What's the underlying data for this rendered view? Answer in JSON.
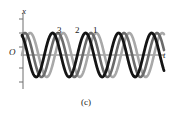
{
  "figure": {
    "caption": "(c)",
    "axes": {
      "y_label": "x",
      "x_label": "t",
      "origin_label": "O",
      "x_axis_start": 22,
      "x_axis_end": 164,
      "x_axis_y": 55,
      "y_axis_x": 23,
      "y_axis_top": 13,
      "y_axis_bottom": 89,
      "y_ticks": [
        19,
        33,
        47,
        68,
        82
      ],
      "tick_length": 4,
      "axis_color": "#6e6e6e"
    },
    "curve_labels": [
      {
        "text": "3",
        "x": 57,
        "y": 26
      },
      {
        "text": "2",
        "x": 75,
        "y": 26
      },
      {
        "text": "1",
        "x": 93,
        "y": 26
      }
    ]
  },
  "chart_data": {
    "type": "line",
    "title": "",
    "subtitle": "",
    "xlabel": "t",
    "ylabel": "x",
    "grid": false,
    "legend": "inline-labels",
    "annotations": [
      "3",
      "2",
      "1",
      "(c)"
    ],
    "xlim": [
      0,
      142
    ],
    "ylim": [
      -1.15,
      1.15
    ],
    "series": [
      {
        "name": "1",
        "label": "1",
        "color": "#a8a8a8",
        "stroke_width": 2.6,
        "amplitude": 1.0,
        "period": 33,
        "phase_deg": 0,
        "t_start": 0,
        "t_end": 142
      },
      {
        "name": "2",
        "label": "2",
        "color": "#6b6b6b",
        "stroke_width": 2.6,
        "amplitude": 1.0,
        "period": 33,
        "phase_deg": 58,
        "t_start": 0,
        "t_end": 142
      },
      {
        "name": "3",
        "label": "3",
        "color": "#141414",
        "stroke_width": 2.8,
        "amplitude": 1.0,
        "period": 33,
        "phase_deg": 116,
        "t_start": 0,
        "t_end": 142
      }
    ]
  }
}
